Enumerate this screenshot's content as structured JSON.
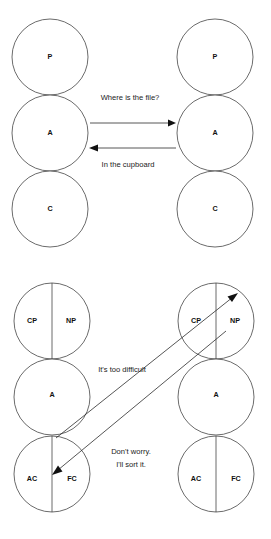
{
  "page": {
    "width": 271,
    "height": 539,
    "background_color": "#ffffff",
    "line_color": "#3a3a3a",
    "text_color": "#1b1b1b"
  },
  "diagrams": [
    {
      "name": "complementary-transaction",
      "left_person": {
        "states": [
          {
            "code": "P",
            "cx": 50,
            "cy": 57,
            "r": 38
          },
          {
            "code": "A",
            "cx": 50,
            "cy": 133,
            "r": 38
          },
          {
            "code": "C",
            "cx": 50,
            "cy": 209,
            "r": 38
          }
        ]
      },
      "right_person": {
        "states": [
          {
            "code": "P",
            "cx": 215,
            "cy": 57,
            "r": 38
          },
          {
            "code": "A",
            "cx": 215,
            "cy": 133,
            "r": 38
          },
          {
            "code": "C",
            "cx": 215,
            "cy": 209,
            "r": 38
          }
        ]
      },
      "transactions": [
        {
          "name": "stimulus-adult-to-adult",
          "label": "Where is the file?",
          "label_x": 130,
          "label_y": 98,
          "x1": 90,
          "y1": 123,
          "x2": 176,
          "y2": 123,
          "direction": "right"
        },
        {
          "name": "response-adult-to-adult",
          "label": "In the cupboard",
          "label_x": 128,
          "label_y": 165,
          "x1": 176,
          "y1": 148,
          "x2": 90,
          "y2": 148,
          "direction": "left"
        }
      ]
    },
    {
      "name": "crossed-transaction",
      "left_person": {
        "states": [
          {
            "code": "CP",
            "cx": 32,
            "cy": 321,
            "r": 38,
            "parent_circle_cx": 52
          },
          {
            "code": "NP",
            "cx": 70,
            "cy": 321,
            "r": 38,
            "parent_circle_cx": 52
          },
          {
            "code": "A",
            "cx": 52,
            "cy": 397,
            "r": 38
          },
          {
            "code": "AC",
            "cx": 33,
            "cy": 474,
            "r": 38,
            "parent_circle_cx": 52
          },
          {
            "code": "FC",
            "cx": 71,
            "cy": 474,
            "r": 38,
            "parent_circle_cx": 52
          }
        ]
      },
      "right_person": {
        "states": [
          {
            "code": "CP",
            "cx": 196,
            "cy": 321,
            "r": 38,
            "parent_circle_cx": 216
          },
          {
            "code": "NP",
            "cx": 234,
            "cy": 321,
            "r": 38,
            "parent_circle_cx": 216
          },
          {
            "code": "A",
            "cx": 216,
            "cy": 397,
            "r": 38
          },
          {
            "code": "AC",
            "cx": 197,
            "cy": 474,
            "r": 38,
            "parent_circle_cx": 216
          },
          {
            "code": "FC",
            "cx": 235,
            "cy": 474,
            "r": 38,
            "parent_circle_cx": 216
          }
        ]
      },
      "transactions": [
        {
          "name": "stimulus-adult-to-parent",
          "label": "It's too difficult",
          "label_x": 122,
          "label_y": 370,
          "x1": 57,
          "y1": 437,
          "x2": 238,
          "y2": 294,
          "direction": "up-right"
        },
        {
          "name": "response-parent-to-child",
          "label_line_1": "Don't worry.",
          "label_line_2": "I'll sort it.",
          "label_x": 131,
          "label_y": 452,
          "label_y2": 465,
          "x1": 223,
          "y1": 334,
          "x2": 51,
          "y2": 478,
          "direction": "down-left"
        }
      ]
    }
  ]
}
